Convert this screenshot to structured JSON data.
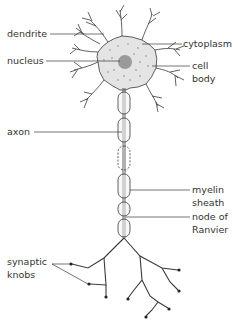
{
  "diagram": {
    "colors": {
      "line": "#3a3a3a",
      "cytoplasm_fill": "#e4e4e4",
      "nucleus_fill": "#9a9a9a",
      "myelin_fill": "#f4f4f4",
      "knob": "#222222"
    },
    "labels": {
      "dendrite": "dendrite",
      "nucleus": "nucleus",
      "cytoplasm": "cytoplasm",
      "cell_body_1": "cell",
      "cell_body_2": "body",
      "axon": "axon",
      "myelin_1": "myelin",
      "myelin_2": "sheath",
      "node_1": "node of",
      "node_2": "Ranvier",
      "synaptic_1": "synaptic",
      "synaptic_2": "knobs"
    }
  }
}
